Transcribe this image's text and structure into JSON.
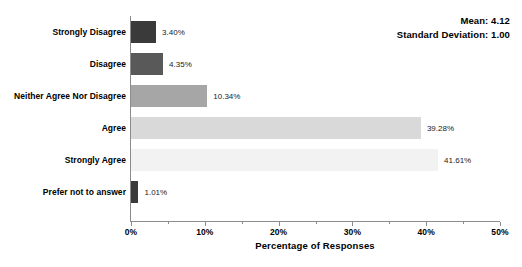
{
  "chart_data": {
    "type": "bar",
    "orientation": "horizontal",
    "title": "",
    "subtitle": "",
    "xlabel": "Percentage of Responses",
    "ylabel": "",
    "categories": [
      "Strongly Disagree",
      "Disagree",
      "Neither Agree Nor Disagree",
      "Agree",
      "Strongly Agree",
      "Prefer not to answer"
    ],
    "values": [
      3.4,
      4.35,
      10.34,
      39.28,
      41.61,
      1.01
    ],
    "value_labels": [
      "3.40%",
      "4.35%",
      "10.34%",
      "39.28%",
      "41.61%",
      "1.01%"
    ],
    "bar_colors": [
      "#3a3a3a",
      "#595959",
      "#a6a6a6",
      "#d9d9d9",
      "#f2f2f2",
      "#3a3a3a"
    ],
    "xlim": [
      0,
      50
    ],
    "xticks": [
      0,
      10,
      20,
      30,
      40,
      50
    ],
    "xtick_labels": [
      "0%",
      "10%",
      "20%",
      "30%",
      "40%",
      "50%"
    ],
    "xminor_ticks": [
      5,
      15,
      25,
      35,
      45
    ],
    "grid": false,
    "legend": false
  },
  "annotations": {
    "mean_text": "Mean: 4.12",
    "std_text": "Standard Deviation: 1.00"
  }
}
